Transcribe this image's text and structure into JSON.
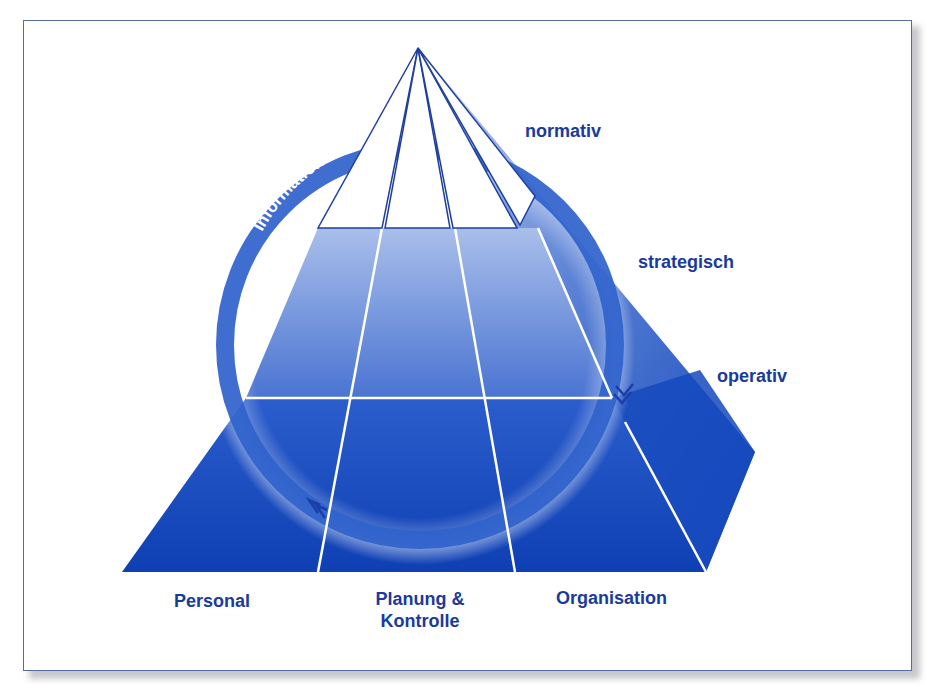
{
  "colors": {
    "frame_border": "#5a6aa8",
    "label_text": "#1a3a9c",
    "deep_blue": "#0f44b8",
    "light_blue": "#9db4e6",
    "ring_blue": "#2f62cc",
    "grid_line": "#ffffff",
    "apex_outline": "#1e3f9e"
  },
  "ring": {
    "label": "Information"
  },
  "levels": {
    "normativ": "normativ",
    "strategisch": "strategisch",
    "operativ": "operativ"
  },
  "functions": {
    "personal": "Personal",
    "planung_line1": "Planung &",
    "planung_line2": "Kontrolle",
    "organisation": "Organisation"
  }
}
